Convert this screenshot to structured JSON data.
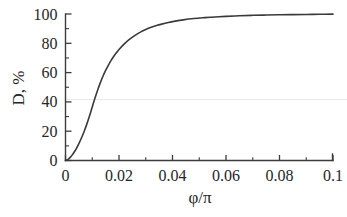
{
  "figure": {
    "background_color": "#ffffff",
    "curve_color": "#3a3a3a",
    "axis_color": "#3c3c3c",
    "artifact_line_color": "#e9e9e9"
  },
  "chart_data": {
    "type": "line",
    "title": "",
    "xlabel": "φ/π",
    "ylabel": "D, %",
    "xlim": [
      0,
      0.1
    ],
    "ylim": [
      0,
      100
    ],
    "grid": false,
    "legend": null,
    "x_ticks": [
      0,
      0.02,
      0.04,
      0.06,
      0.08,
      0.1
    ],
    "x_tick_labels": [
      "0",
      "0.02",
      "0.04",
      "0.06",
      "0.08",
      "0.1"
    ],
    "x_minor_ticks": [
      0.01,
      0.03,
      0.05,
      0.07,
      0.09
    ],
    "y_ticks": [
      0,
      20,
      40,
      60,
      80,
      100
    ],
    "y_tick_labels": [
      "0",
      "20",
      "40",
      "60",
      "80",
      "100"
    ],
    "y_minor_ticks": [
      10,
      30,
      50,
      70,
      90
    ],
    "series": [
      {
        "name": "D",
        "x": [
          0.0,
          0.0008,
          0.0016,
          0.0024,
          0.0032,
          0.004,
          0.005,
          0.006,
          0.007,
          0.008,
          0.009,
          0.01,
          0.011,
          0.012,
          0.013,
          0.014,
          0.015,
          0.016,
          0.017,
          0.018,
          0.019,
          0.02,
          0.022,
          0.024,
          0.026,
          0.028,
          0.03,
          0.032,
          0.034,
          0.036,
          0.038,
          0.04,
          0.044,
          0.048,
          0.052,
          0.056,
          0.06,
          0.065,
          0.07,
          0.075,
          0.08,
          0.085,
          0.09,
          0.095,
          0.1
        ],
        "y": [
          0.0,
          0.6,
          1.8,
          3.5,
          5.6,
          8.0,
          11.5,
          15.5,
          20.0,
          25.0,
          30.5,
          36.5,
          42.5,
          48.0,
          53.0,
          57.5,
          61.5,
          65.0,
          68.2,
          71.0,
          73.5,
          75.8,
          79.6,
          82.8,
          85.4,
          87.6,
          89.4,
          90.9,
          92.1,
          93.1,
          94.0,
          94.8,
          96.0,
          96.9,
          97.5,
          98.0,
          98.4,
          98.8,
          99.1,
          99.3,
          99.5,
          99.6,
          99.7,
          99.8,
          99.9
        ]
      }
    ]
  }
}
